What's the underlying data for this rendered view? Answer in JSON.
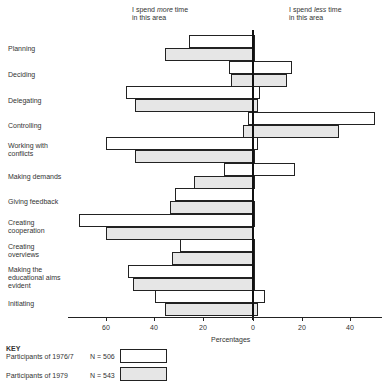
{
  "chart_data": {
    "type": "bar",
    "orientation": "horizontal",
    "title": "",
    "annotations": {
      "left": [
        "I spend more time",
        "in this area"
      ],
      "right": [
        "I spend less time",
        "in this area"
      ]
    },
    "xlabel": "Percentages",
    "ylabel": "",
    "x_ticks": [
      "60",
      "40",
      "20",
      "0",
      "20",
      "40"
    ],
    "x_tick_values": [
      -60,
      -40,
      -20,
      0,
      20,
      40
    ],
    "xlim": [
      -72,
      50
    ],
    "grid": false,
    "legend_position": "bottom-left",
    "categories": [
      "Planning",
      "Deciding",
      "Delegating",
      "Controlling",
      "Working with conflicts",
      "Making demands",
      "Giving feedback",
      "Creating cooperation",
      "Creating overviews",
      "Making the educational aims evident",
      "Initiating"
    ],
    "series": [
      {
        "name": "Participants of 1976/7",
        "n": "N = 506",
        "fill": "white",
        "more_time": [
          -26,
          -10,
          -52,
          -2,
          -60,
          -12,
          -32,
          -71,
          -30,
          -51,
          -40
        ],
        "less_time": [
          1,
          16,
          3,
          50,
          2,
          17,
          0.5,
          1,
          1,
          1,
          5
        ]
      },
      {
        "name": "Participants of 1979",
        "n": "N = 543",
        "fill": "dotted",
        "more_time": [
          -36,
          -9,
          -48,
          -4,
          -48,
          -24,
          -34,
          -60,
          -33,
          -49,
          -36
        ],
        "less_time": [
          1,
          14,
          2,
          35,
          1,
          1,
          1,
          0,
          1,
          1,
          2
        ]
      }
    ]
  },
  "labels": {
    "more_line1": "I spend ",
    "more_em": "more",
    "more_line1_end": " time",
    "more_line2": "in this area",
    "less_line1": "I spend ",
    "less_em": "less",
    "less_line1_end": " time",
    "less_line2": "in this area",
    "cat0": "Planning",
    "cat1": "Deciding",
    "cat2": "Delegating",
    "cat3": "Controlling",
    "cat4a": "Working with",
    "cat4b": "conflicts",
    "cat5": "Making demands",
    "cat6": "Giving feedback",
    "cat7a": "Creating",
    "cat7b": "cooperation",
    "cat8a": "Creating",
    "cat8b": "overviews",
    "cat9a": "Making the",
    "cat9b": "educational aims",
    "cat9c": "evident",
    "cat10": "Initiating",
    "tick0": "60",
    "tick1": "40",
    "tick2": "20",
    "tick3": "0",
    "tick4": "20",
    "tick5": "40",
    "xlabel": "Percentages",
    "key_title": "KEY",
    "key1_label": "Participants of 1976/7",
    "key1_n": "N = 506",
    "key2_label": "Participants of 1979",
    "key2_n": "N = 543"
  }
}
